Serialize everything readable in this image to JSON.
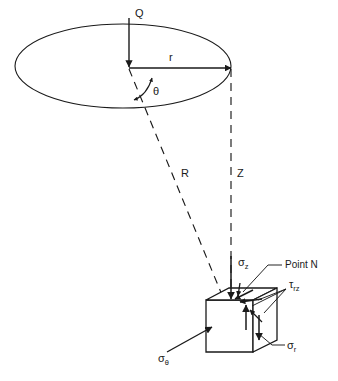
{
  "figure": {
    "type": "engineering-stress-diagram",
    "background_color": "#ffffff",
    "line_color": "#1a1a1a"
  },
  "labels": {
    "load": "Q",
    "radial_distance": "r",
    "angle": "θ",
    "slant_distance": "R",
    "depth": "Z",
    "point": "Point N"
  },
  "stresses": [
    {
      "id": "sigma-z",
      "symbol": "σ",
      "subscript": "z",
      "name": "vertical-stress"
    },
    {
      "id": "sigma-theta",
      "symbol": "σ",
      "subscript": "θ",
      "name": "tangential-stress"
    },
    {
      "id": "sigma-r",
      "symbol": "σ",
      "subscript": "r",
      "name": "radial-stress"
    },
    {
      "id": "tau-rz",
      "symbol": "τ",
      "subscript": "rz",
      "name": "shear-stress"
    }
  ],
  "geometry": {
    "surface_shape": "ellipse",
    "element_shape": "cube",
    "load_direction": "downward"
  }
}
